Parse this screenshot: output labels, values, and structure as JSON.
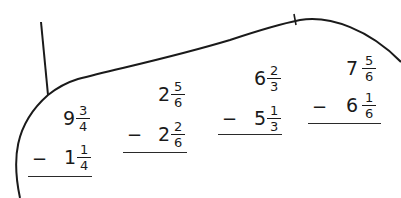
{
  "worksheet": {
    "problems": [
      {
        "top": {
          "whole": "9",
          "num": "3",
          "den": "4"
        },
        "bottom": {
          "whole": "1",
          "num": "1",
          "den": "4"
        },
        "operator": "−"
      },
      {
        "top": {
          "whole": "2",
          "num": "5",
          "den": "6"
        },
        "bottom": {
          "whole": "2",
          "num": "2",
          "den": "6"
        },
        "operator": "−"
      },
      {
        "top": {
          "whole": "6",
          "num": "2",
          "den": "3"
        },
        "bottom": {
          "whole": "5",
          "num": "1",
          "den": "3"
        },
        "operator": "−"
      },
      {
        "top": {
          "whole": "7",
          "num": "5",
          "den": "6"
        },
        "bottom": {
          "whole": "6",
          "num": "1",
          "den": "6"
        },
        "operator": "−"
      }
    ]
  }
}
